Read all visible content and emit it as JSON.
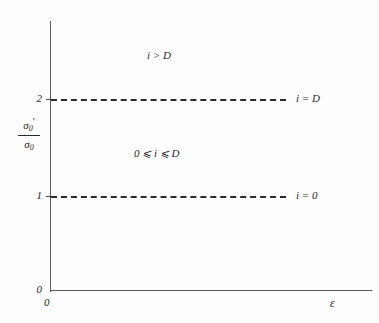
{
  "chart_data": {
    "type": "line",
    "title": "",
    "xlabel": "ε",
    "ylabel_numerator": "σ",
    "ylabel_numerator_sub": "0",
    "ylabel_numerator_prime": "′",
    "ylabel_denominator": "σ",
    "ylabel_denominator_sub": "0",
    "ylabel_plain": "σ₀′ / σ₀",
    "xlim": [
      0,
      1
    ],
    "ylim": [
      0,
      2.8
    ],
    "grid": false,
    "legend": "none",
    "x_ticks": [
      "0"
    ],
    "y_ticks": [
      "0",
      "1",
      "2"
    ],
    "y_tick_values": [
      0,
      1,
      2
    ],
    "series": [
      {
        "name": "i = D",
        "style": "dashed",
        "y": 2,
        "label": "i = D",
        "label_x_fraction": 0.76
      },
      {
        "name": "i = 0",
        "style": "dashed",
        "y": 1,
        "label": "i = 0",
        "label_x_fraction": 0.76
      }
    ],
    "annotations": [
      {
        "name": "region-upper",
        "text": "i > D",
        "x_fraction": 0.3,
        "y_value": 2.45
      },
      {
        "name": "region-middle",
        "text": "0 ⩽ i ⩽ D",
        "x_fraction": 0.26,
        "y_value": 1.45
      }
    ]
  },
  "axes": {
    "y_tick_2": "2",
    "y_tick_1": "1",
    "y_tick_0": "0",
    "x_tick_0": "0",
    "x_axis_label": "ε"
  },
  "labels": {
    "line_upper": "i = D",
    "line_lower": "i = 0",
    "region_upper": "i > D",
    "region_middle": "0 ⩽ i ⩽ D"
  },
  "sigma": {
    "glyph": "σ",
    "subscript": "0",
    "prime": "′"
  },
  "colors": {
    "background": "#fdfdfd",
    "axis": "#5a5a5a",
    "line": "#2a2a2a",
    "text": "#1f1f1f"
  }
}
